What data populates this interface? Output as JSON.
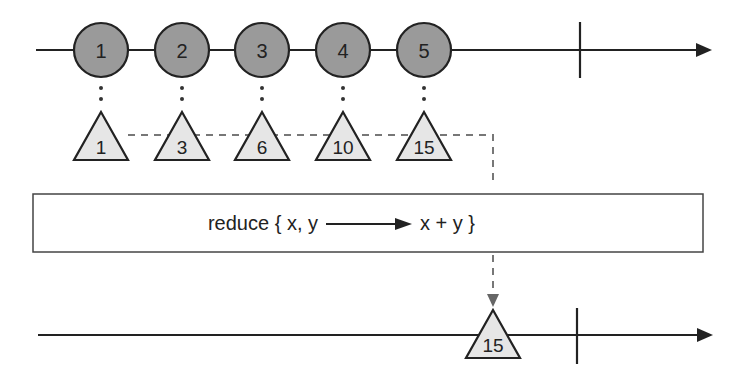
{
  "diagram": {
    "type": "marble-diagram",
    "operator_label": "reduce { x, y",
    "operator_label_result": "x + y }",
    "source": {
      "items": [
        {
          "value": "1",
          "x": 101
        },
        {
          "value": "2",
          "x": 182
        },
        {
          "value": "3",
          "x": 262
        },
        {
          "value": "4",
          "x": 343
        },
        {
          "value": "5",
          "x": 424
        }
      ],
      "complete_x": 580
    },
    "accumulated": [
      {
        "value": "1",
        "x": 101
      },
      {
        "value": "3",
        "x": 182
      },
      {
        "value": "6",
        "x": 262
      },
      {
        "value": "10",
        "x": 343
      },
      {
        "value": "15",
        "x": 424
      }
    ],
    "output": {
      "items": [
        {
          "value": "15",
          "x": 493
        }
      ],
      "complete_x": 577
    },
    "colors": {
      "marble_fill": "#9a9a9a",
      "triangle_fill": "#e6e6e6",
      "line": "#222222",
      "dashed": "#777777"
    }
  }
}
